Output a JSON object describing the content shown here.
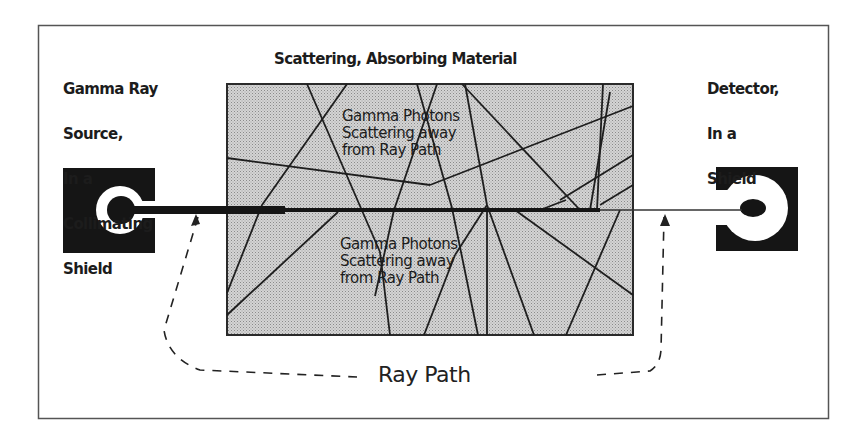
{
  "diagram": {
    "source_label": [
      "Gamma Ray",
      "Source,",
      "In a",
      "Collimating",
      "Shield"
    ],
    "material_title": "Scattering, Absorbing Material",
    "detector_label": [
      "Detector,",
      "In a",
      "Shield"
    ],
    "scatter_upper": [
      "Gamma Photons",
      "Scattering away",
      "from Ray Path"
    ],
    "scatter_lower": [
      "Gamma Photons",
      "Scattering away",
      "from Ray Path"
    ],
    "ray_path_label": "Ray Path"
  },
  "colors": {
    "frame": "#555555",
    "material_fill": "#c9c9c9",
    "shield": "#151515",
    "lines": "#222222",
    "background": "#ffffff"
  }
}
